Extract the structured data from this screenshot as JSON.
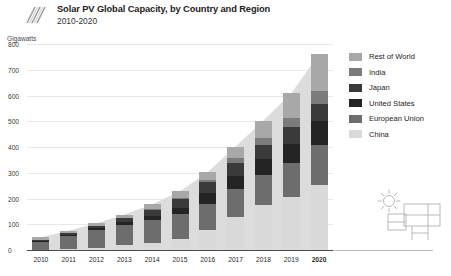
{
  "header": {
    "title": "Solar PV Global Capacity, by Country and Region",
    "subtitle": "2010-2020",
    "logo_icon": "diagonal-stripes-logo"
  },
  "axis_unit_label": "Gigawatts",
  "decoration": {
    "icon": "solar-panel-with-sun-icon"
  },
  "legend": {
    "items": [
      {
        "label": "Rest of World",
        "color": "#a8a8a8"
      },
      {
        "label": "India",
        "color": "#7b7b7b"
      },
      {
        "label": "Japan",
        "color": "#3a3a3a"
      },
      {
        "label": "United States",
        "color": "#242424"
      },
      {
        "label": "European Union",
        "color": "#6d6d6d"
      },
      {
        "label": "China",
        "color": "#d9d9d9"
      }
    ]
  },
  "chart_data": {
    "type": "bar",
    "title": "Solar PV Global Capacity, by Country and Region",
    "subtitle": "2010-2020",
    "xlabel": "",
    "ylabel": "Gigawatts",
    "ylim": [
      0,
      800
    ],
    "yticks": [
      0,
      100,
      200,
      300,
      400,
      500,
      600,
      700,
      800
    ],
    "ytick_labels": [
      "0",
      "100",
      "200",
      "300",
      "400",
      "500",
      "600",
      "700",
      "800"
    ],
    "grid": true,
    "legend_position": "right",
    "stacked": true,
    "stack_order_bottom_to_top": [
      "China",
      "European Union",
      "United States",
      "Japan",
      "India",
      "Rest of World"
    ],
    "categories": [
      "2010",
      "2011",
      "2012",
      "2013",
      "2014",
      "2015",
      "2016",
      "2017",
      "2018",
      "2019",
      "2020"
    ],
    "series": [
      {
        "name": "China",
        "color": "#d9d9d9",
        "values": [
          1,
          3,
          7,
          18,
          28,
          43,
          77,
          130,
          175,
          205,
          254
        ]
      },
      {
        "name": "European Union",
        "color": "#6d6d6d",
        "values": [
          30,
          52,
          70,
          80,
          88,
          95,
          102,
          107,
          115,
          132,
          152
        ]
      },
      {
        "name": "United States",
        "color": "#242424",
        "values": [
          3,
          5,
          8,
          12,
          18,
          25,
          41,
          51,
          62,
          76,
          94
        ]
      },
      {
        "name": "Japan",
        "color": "#3a3a3a",
        "values": [
          4,
          5,
          7,
          14,
          23,
          34,
          43,
          49,
          56,
          63,
          68
        ]
      },
      {
        "name": "India",
        "color": "#7b7b7b",
        "values": [
          0,
          1,
          1,
          2,
          3,
          5,
          9,
          19,
          27,
          35,
          48
        ]
      },
      {
        "name": "Rest of World",
        "color": "#a8a8a8",
        "values": [
          12,
          9,
          11,
          12,
          17,
          26,
          31,
          46,
          68,
          98,
          144
        ]
      }
    ],
    "totals": [
      50,
      75,
      104,
      138,
      177,
      228,
      303,
      402,
      503,
      609,
      760
    ],
    "area_underlay": {
      "shown": true,
      "color": "#dcdcdc",
      "values": [
        50,
        75,
        104,
        138,
        177,
        228,
        303,
        402,
        503,
        609,
        760
      ]
    }
  }
}
